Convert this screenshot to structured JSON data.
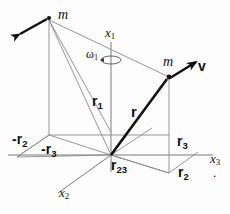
{
  "figure": {
    "colors": {
      "thin_line": "#7a7a7a",
      "bold_line": "#101010",
      "text": "#111111",
      "background": "#fdfdfd"
    },
    "labels": {
      "mass_upper_left": "m",
      "mass_right": "m",
      "velocity": "v",
      "omega": "ω",
      "omega_sub": "1",
      "axis_x1": "x",
      "axis_x1_sub": "1",
      "axis_x2": "x",
      "axis_x2_sub": "2",
      "axis_x3": "x",
      "axis_x3_sub": "3",
      "r1": "r",
      "r1_sub": "1",
      "r_vector": "r",
      "r23": "r",
      "r23_sub": "23",
      "r2_pos": "r",
      "r2_pos_sub": "2",
      "r3_pos": "r",
      "r3_pos_sub": "3",
      "r2_neg": "-r",
      "r2_neg_sub": "2",
      "r3_neg": "-r",
      "r3_neg_sub": "3",
      "stray_dot": "."
    },
    "geometry": {
      "origin": [
        111,
        155
      ],
      "mass_upper_left": [
        49,
        18
      ],
      "mass_right": [
        169,
        77
      ],
      "x1_axis_top": [
        111,
        42
      ],
      "x3_axis_right": [
        213,
        155
      ],
      "x2_axis_lower_left": [
        58,
        196
      ]
    }
  }
}
